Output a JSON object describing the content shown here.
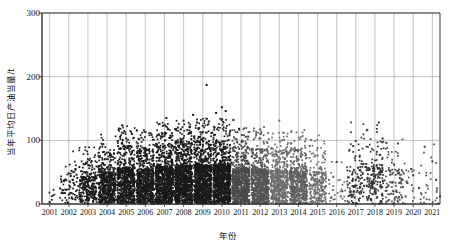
{
  "chart_data": {
    "type": "scatter",
    "title": "",
    "xlabel": "年份",
    "ylabel": "当年平均日产油当量/t",
    "xlim": [
      2000.6,
      2021.4
    ],
    "ylim": [
      0,
      300
    ],
    "yticks": [
      0,
      100,
      200,
      300
    ],
    "xticks": [
      2001,
      2002,
      2003,
      2004,
      2005,
      2006,
      2007,
      2008,
      2009,
      2010,
      2011,
      2012,
      2013,
      2014,
      2015,
      2016,
      2017,
      2018,
      2019,
      2020,
      2021
    ],
    "grid": "vertical-and-horizontal",
    "legend": "none",
    "marker": "square",
    "colors": {
      "dark": "#1a1a1a",
      "mid_gray": "#6e6e6e",
      "light_gray": "#9a9a9a",
      "axis": "#333333",
      "grid": "#9a9a9a"
    },
    "series": [
      {
        "name": "2001-2010 (dark)",
        "color": "#1a1a1a",
        "points": [
          [
            2001.0,
            3
          ],
          [
            2002.0,
            48
          ],
          [
            2002.1,
            44
          ],
          [
            2002.15,
            52
          ],
          [
            2002.2,
            38
          ],
          [
            2002.25,
            33
          ],
          [
            2002.3,
            30
          ],
          [
            2002.35,
            55
          ],
          [
            2002.4,
            46
          ],
          [
            2002.45,
            41
          ],
          [
            2002.5,
            28
          ],
          [
            2002.55,
            58
          ],
          [
            2002.6,
            36
          ],
          [
            2002.65,
            43
          ],
          [
            2002.7,
            25
          ],
          [
            2002.8,
            50
          ],
          [
            2002.85,
            31
          ],
          [
            2002.9,
            39
          ],
          [
            2002.95,
            22
          ],
          [
            2003.0,
            34
          ],
          [
            2003.05,
            61
          ],
          [
            2003.1,
            47
          ],
          [
            2003.15,
            18
          ],
          [
            2003.2,
            54
          ],
          [
            2003.25,
            29
          ],
          [
            2003.3,
            42
          ],
          [
            2003.35,
            37
          ],
          [
            2003.4,
            26
          ],
          [
            2003.45,
            59
          ],
          [
            2003.5,
            45
          ],
          [
            2003.55,
            32
          ],
          [
            2003.6,
            51
          ],
          [
            2003.65,
            21
          ],
          [
            2003.7,
            40
          ],
          [
            2003.75,
            35
          ],
          [
            2003.8,
            63
          ],
          [
            2003.85,
            27
          ],
          [
            2003.9,
            49
          ],
          [
            2003.95,
            15
          ],
          [
            2004.0,
            57
          ],
          [
            2004.1,
            44
          ],
          [
            2004.2,
            69
          ],
          [
            2004.3,
            38
          ],
          [
            2004.4,
            72
          ],
          [
            2004.5,
            30
          ],
          [
            2004.6,
            55
          ],
          [
            2004.7,
            66
          ],
          [
            2004.8,
            24
          ],
          [
            2004.9,
            79
          ],
          [
            2005.0,
            103
          ],
          [
            2005.1,
            88
          ],
          [
            2005.2,
            46
          ],
          [
            2005.3,
            110
          ],
          [
            2005.4,
            62
          ],
          [
            2005.5,
            35
          ],
          [
            2005.6,
            95
          ],
          [
            2005.7,
            41
          ],
          [
            2005.8,
            104
          ],
          [
            2005.9,
            53
          ],
          [
            2006.0,
            77
          ],
          [
            2006.1,
            29
          ],
          [
            2006.2,
            86
          ],
          [
            2006.3,
            58
          ],
          [
            2006.4,
            44
          ],
          [
            2006.5,
            92
          ],
          [
            2006.6,
            36
          ],
          [
            2006.7,
            68
          ],
          [
            2006.8,
            51
          ],
          [
            2006.9,
            80
          ],
          [
            2007.0,
            107
          ],
          [
            2007.1,
            135
          ],
          [
            2007.2,
            47
          ],
          [
            2007.3,
            73
          ],
          [
            2007.4,
            33
          ],
          [
            2007.5,
            89
          ],
          [
            2007.6,
            56
          ],
          [
            2007.7,
            120
          ],
          [
            2007.8,
            42
          ],
          [
            2007.9,
            98
          ],
          [
            2008.0,
            131
          ],
          [
            2008.1,
            64
          ],
          [
            2008.2,
            116
          ],
          [
            2008.3,
            38
          ],
          [
            2008.4,
            83
          ],
          [
            2008.5,
            140
          ],
          [
            2008.6,
            52
          ],
          [
            2008.7,
            128
          ],
          [
            2008.8,
            45
          ],
          [
            2008.9,
            101
          ],
          [
            2009.0,
            123
          ],
          [
            2009.1,
            70
          ],
          [
            2009.2,
            187
          ],
          [
            2009.3,
            94
          ],
          [
            2009.4,
            37
          ],
          [
            2009.5,
            112
          ],
          [
            2009.6,
            60
          ],
          [
            2009.7,
            143
          ],
          [
            2009.8,
            48
          ],
          [
            2009.9,
            86
          ],
          [
            2010.0,
            152
          ],
          [
            2010.1,
            74
          ],
          [
            2010.2,
            146
          ],
          [
            2010.3,
            40
          ],
          [
            2010.4,
            108
          ],
          [
            2010.5,
            65
          ],
          [
            2010.6,
            132
          ],
          [
            2010.7,
            54
          ],
          [
            2010.8,
            97
          ],
          [
            2010.9,
            118
          ]
        ]
      },
      {
        "name": "2011-2015 (gray cluster)",
        "color": "#6e6e6e",
        "points": [
          [
            2011.0,
            92
          ],
          [
            2011.2,
            68
          ],
          [
            2011.4,
            45
          ],
          [
            2011.6,
            80
          ],
          [
            2011.8,
            33
          ],
          [
            2012.0,
            117
          ],
          [
            2012.2,
            121
          ],
          [
            2012.4,
            57
          ],
          [
            2012.6,
            88
          ],
          [
            2012.8,
            41
          ],
          [
            2013.0,
            131
          ],
          [
            2013.2,
            73
          ],
          [
            2013.4,
            50
          ],
          [
            2013.6,
            95
          ],
          [
            2013.8,
            36
          ],
          [
            2014.0,
            84
          ],
          [
            2014.2,
            62
          ],
          [
            2014.4,
            47
          ],
          [
            2014.6,
            91
          ],
          [
            2014.8,
            29
          ],
          [
            2015.0,
            88
          ],
          [
            2015.2,
            55
          ],
          [
            2015.4,
            70
          ],
          [
            2015.6,
            38
          ],
          [
            2015.8,
            22
          ]
        ]
      },
      {
        "name": "2016-2021 (sparse)",
        "color": "#3a3a3a",
        "points": [
          [
            2016.0,
            66
          ],
          [
            2016.3,
            20
          ],
          [
            2016.6,
            42
          ],
          [
            2017.0,
            99
          ],
          [
            2017.2,
            76
          ],
          [
            2017.4,
            63
          ],
          [
            2017.5,
            58
          ],
          [
            2017.6,
            40
          ],
          [
            2017.7,
            31
          ],
          [
            2017.8,
            27
          ],
          [
            2017.9,
            35
          ],
          [
            2018.0,
            44
          ],
          [
            2018.1,
            82
          ],
          [
            2018.2,
            128
          ],
          [
            2018.3,
            51
          ],
          [
            2018.4,
            103
          ],
          [
            2018.5,
            37
          ],
          [
            2018.6,
            96
          ],
          [
            2018.7,
            29
          ],
          [
            2018.8,
            46
          ],
          [
            2019.0,
            62
          ],
          [
            2019.2,
            95
          ],
          [
            2019.3,
            41
          ],
          [
            2019.5,
            48
          ],
          [
            2019.7,
            33
          ],
          [
            2019.9,
            55
          ],
          [
            2020.0,
            45
          ],
          [
            2020.3,
            25
          ],
          [
            2020.6,
            90
          ],
          [
            2021.0,
            67
          ],
          [
            2021.2,
            38
          ],
          [
            2021.4,
            12
          ]
        ]
      }
    ]
  }
}
